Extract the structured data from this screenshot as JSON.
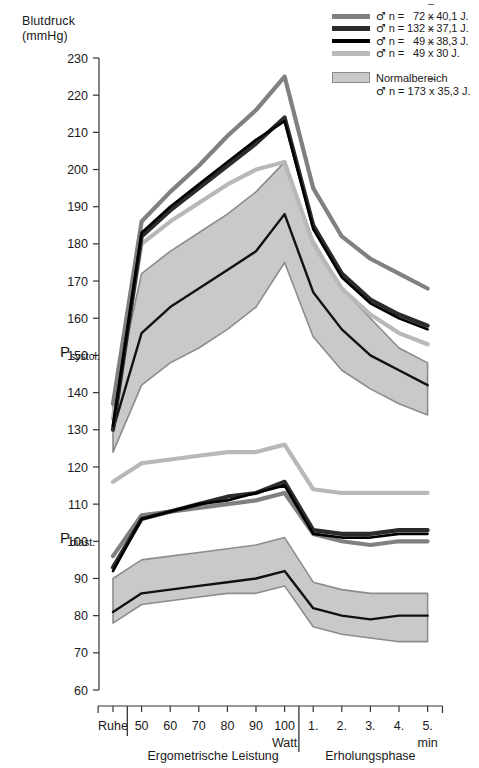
{
  "axis": {
    "title": "Blutdruck\n(mmHg)",
    "y_ticks": [
      230,
      220,
      210,
      200,
      190,
      180,
      170,
      160,
      150,
      140,
      130,
      120,
      110,
      100,
      90,
      80,
      70,
      60
    ],
    "y_min": 60,
    "y_max": 230,
    "series_labels": {
      "systolic": "P",
      "systolic_sub": "systol.",
      "diastolic": "P",
      "diastolic_sub": "diast."
    }
  },
  "legend": {
    "entries": [
      {
        "color": "#808080",
        "weight": 5,
        "text": "♂ n =   72 x 40,1 J.",
        "n": 72,
        "mean_age": "40,1"
      },
      {
        "color": "#2b2b2b",
        "weight": 5,
        "text": "♂ n = 132 x 37,1 J.",
        "n": 132,
        "mean_age": "37,1"
      },
      {
        "color": "#000000",
        "weight": 4,
        "text": "♂ n =   49 x 38,3 J.",
        "n": 49,
        "mean_age": "38,3"
      },
      {
        "color": "#b8b8b8",
        "weight": 5,
        "text": "♂ n =   49 x 30 J.",
        "n": 49,
        "mean_age": "30"
      }
    ],
    "band": {
      "label": "Normalbereich",
      "sub": "♂ n = 173 x 35,3 J.",
      "fill": "#c9c9c9",
      "stroke": "#8c8c8c"
    }
  },
  "xaxis": {
    "categories": [
      "Ruhe",
      "50",
      "60",
      "70",
      "80",
      "90",
      "100",
      "1.",
      "2.",
      "3.",
      "4.",
      "5."
    ],
    "unit_watt": "Watt",
    "unit_min": "min",
    "groups": [
      {
        "label": "Ergometrische Leistung",
        "from": 1,
        "to": 6
      },
      {
        "label": "Erholungsphase",
        "from": 7,
        "to": 11
      }
    ]
  },
  "chart_data": {
    "type": "line",
    "title": "Blutdruck (mmHg)",
    "xlabel": "Ergometrische Leistung / Erholungsphase",
    "ylabel": "Blutdruck (mmHg)",
    "ylim": [
      60,
      230
    ],
    "grid": false,
    "legend_position": "top-right",
    "x": [
      "Ruhe",
      "50",
      "60",
      "70",
      "80",
      "90",
      "100",
      "1.",
      "2.",
      "3.",
      "4.",
      "5."
    ],
    "series": [
      {
        "name": "♂ n = 72 x̄ 40,1 J. (systolisch)",
        "group": "systolic",
        "color": "#808080",
        "width": 4.2,
        "values": [
          137,
          186,
          194,
          201,
          209,
          216,
          225,
          195,
          182,
          176,
          172,
          168
        ]
      },
      {
        "name": "♂ n = 132 x̄ 37,1 J. (systolisch)",
        "group": "systolic",
        "color": "#2b2b2b",
        "width": 4.2,
        "values": [
          130,
          182,
          189,
          195,
          201,
          207,
          214,
          185,
          172,
          165,
          161,
          158
        ]
      },
      {
        "name": "♂ n = 49 x̄ 38,3 J. (systolisch)",
        "group": "systolic",
        "color": "#000000",
        "width": 2.6,
        "values": [
          131,
          183,
          190,
          196,
          202,
          208,
          213,
          184,
          171,
          164,
          160,
          157
        ]
      },
      {
        "name": "♂ n = 49 x̄ 30 J. (systolisch)",
        "group": "systolic",
        "color": "#b8b8b8",
        "width": 4.2,
        "values": [
          133,
          180,
          186,
          191,
          196,
          200,
          202,
          180,
          168,
          161,
          156,
          153
        ]
      },
      {
        "name": "♂ n = 72 x̄ 40,1 J. (diastolisch)",
        "group": "diastolic",
        "color": "#808080",
        "width": 4.2,
        "values": [
          96,
          107,
          108,
          109,
          110,
          111,
          113,
          102,
          100,
          99,
          100,
          100
        ]
      },
      {
        "name": "♂ n = 132 x̄ 37,1 J. (diastolisch)",
        "group": "diastolic",
        "color": "#2b2b2b",
        "width": 4.2,
        "values": [
          93,
          106,
          108,
          110,
          112,
          113,
          116,
          103,
          102,
          102,
          103,
          103
        ]
      },
      {
        "name": "♂ n = 49 x̄ 38,3 J. (diastolisch)",
        "group": "diastolic",
        "color": "#000000",
        "width": 2.6,
        "values": [
          92,
          106,
          108,
          110,
          111,
          113,
          115,
          102,
          101,
          101,
          102,
          102
        ]
      },
      {
        "name": "♂ n = 49 x̄ 30 J. (diastolisch)",
        "group": "diastolic",
        "color": "#b8b8b8",
        "width": 4.2,
        "values": [
          116,
          121,
          122,
          123,
          124,
          124,
          126,
          114,
          113,
          113,
          113,
          113
        ]
      }
    ],
    "bands": [
      {
        "name": "Normalbereich systolisch",
        "fill": "#c9c9c9",
        "stroke": "#8c8c8c",
        "upper": [
          137,
          172,
          178,
          183,
          188,
          194,
          202,
          181,
          168,
          160,
          152,
          148
        ],
        "lower": [
          124,
          142,
          148,
          152,
          157,
          163,
          175,
          155,
          146,
          141,
          137,
          134
        ]
      },
      {
        "name": "Normalbereich diastolisch",
        "fill": "#c9c9c9",
        "stroke": "#8c8c8c",
        "upper": [
          90,
          95,
          96,
          97,
          98,
          99,
          101,
          89,
          87,
          86,
          86,
          86
        ],
        "lower": [
          78,
          83,
          84,
          85,
          86,
          86,
          88,
          77,
          75,
          74,
          73,
          73
        ]
      }
    ],
    "band_center": [
      {
        "name": "Normalbereich systolisch Mittelwert",
        "color": "#111111",
        "width": 2.4,
        "values": [
          130,
          156,
          163,
          168,
          173,
          178,
          188,
          167,
          157,
          150,
          146,
          142
        ]
      },
      {
        "name": "Normalbereich diastolisch Mittelwert",
        "color": "#111111",
        "width": 2.4,
        "values": [
          81,
          86,
          87,
          88,
          89,
          90,
          92,
          82,
          80,
          79,
          80,
          80
        ]
      }
    ]
  }
}
